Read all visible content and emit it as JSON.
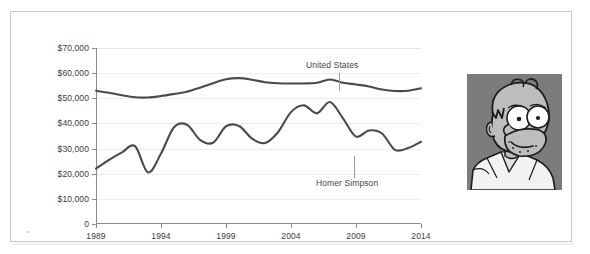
{
  "figure": {
    "background_color": "#ffffff",
    "frame_color": "#c8c8c8"
  },
  "chart_data": {
    "type": "line",
    "title": "",
    "subtitle": "",
    "xlabel": "",
    "ylabel": "",
    "grid": true,
    "legend_position": "inline-annotations",
    "xlim": [
      1989,
      2014
    ],
    "ylim": [
      0,
      70000
    ],
    "y_tick_labels": [
      "$70,000",
      "$60,000",
      "$50,000",
      "$40,000",
      "$30,000",
      "$20,000",
      "$10,000",
      "0"
    ],
    "y_tick_values": [
      70000,
      60000,
      50000,
      40000,
      30000,
      20000,
      10000,
      0
    ],
    "x_tick_labels": [
      "1989",
      "1994",
      "1999",
      "2004",
      "2009",
      "2014"
    ],
    "x_tick_values": [
      1989,
      1994,
      1999,
      2004,
      2009,
      2014
    ],
    "x": [
      1989,
      1990,
      1991,
      1992,
      1993,
      1994,
      1995,
      1996,
      1997,
      1998,
      1999,
      2000,
      2001,
      2002,
      2003,
      2004,
      2005,
      2006,
      2007,
      2008,
      2009,
      2010,
      2011,
      2012,
      2013,
      2014
    ],
    "series": [
      {
        "name": "United States",
        "color": "#4a4a4a",
        "label_position": "above-right",
        "values": [
          53000,
          52200,
          51200,
          50400,
          50300,
          50900,
          51700,
          52600,
          54200,
          56000,
          57600,
          58000,
          57400,
          56400,
          56000,
          55900,
          55900,
          56200,
          57500,
          56200,
          55500,
          54700,
          53500,
          52900,
          53000,
          54000
        ]
      },
      {
        "name": "Homer Simpson",
        "color": "#4a4a4a",
        "label_position": "below-right",
        "values": [
          22000,
          25500,
          28500,
          31000,
          20500,
          28000,
          38500,
          39500,
          33500,
          32300,
          38800,
          39000,
          34000,
          32200,
          36500,
          44500,
          47200,
          44000,
          48500,
          42000,
          34800,
          37200,
          36000,
          29500,
          30200,
          32700
        ]
      }
    ],
    "annotations": [
      {
        "text": "United States",
        "series": "United States",
        "anchor_year": 2013
      },
      {
        "text": "Homer Simpson",
        "series": "Homer Simpson",
        "anchor_year": 2014
      }
    ]
  },
  "annotations": {
    "united_states_label": "United States",
    "homer_simpson_label": "Homer Simpson"
  },
  "photo": {
    "alt": "homer-simpson-portrait",
    "background_color": "#7c7c7c",
    "skin_color": "#bdbdbd",
    "outline_color": "#1c1c1c",
    "shirt_color": "#f2f2f2"
  }
}
